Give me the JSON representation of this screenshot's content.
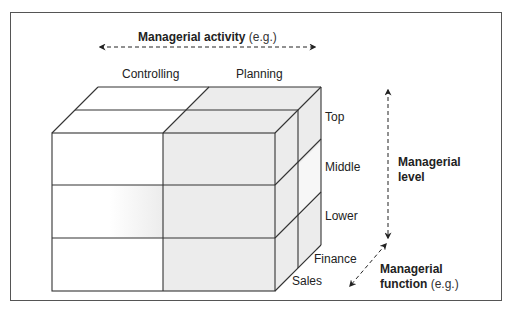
{
  "diagram": {
    "type": "3d-cube-matrix",
    "axes": {
      "activity": {
        "title": "Managerial activity",
        "suffix": "(e.g.)",
        "values": [
          "Controlling",
          "Planning"
        ]
      },
      "level": {
        "title_line1": "Managerial",
        "title_line2": "level",
        "values": [
          "Top",
          "Middle",
          "Lower"
        ]
      },
      "function": {
        "title_line1": "Managerial",
        "title_line2": "function",
        "suffix": "(e.g.)",
        "values": [
          "Finance",
          "Sales"
        ]
      }
    },
    "colors": {
      "line": "#333333",
      "shaded_cell": "#ececec",
      "frame": "#555555",
      "arrow": "#222222"
    }
  }
}
